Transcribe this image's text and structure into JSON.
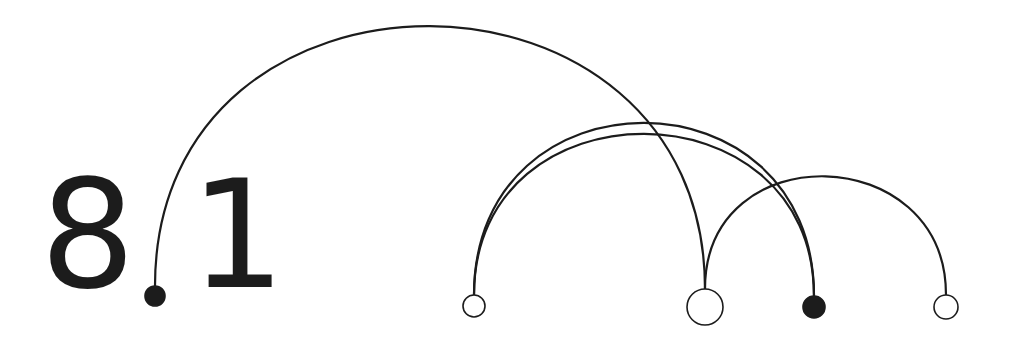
{
  "label": {
    "major": "8",
    "minor": "1"
  },
  "colors": {
    "stroke": "#1c1c1c",
    "background": "#ffffff"
  },
  "nodes": [
    {
      "id": "dot",
      "cx": 155,
      "cy": 296,
      "r": 10,
      "filled": true
    },
    {
      "id": "a",
      "cx": 474,
      "cy": 306,
      "r": 11,
      "filled": false
    },
    {
      "id": "b",
      "cx": 705,
      "cy": 307,
      "r": 18,
      "filled": false
    },
    {
      "id": "c",
      "cx": 814,
      "cy": 307,
      "r": 11,
      "filled": true
    },
    {
      "id": "d",
      "cx": 946,
      "cy": 307,
      "r": 12,
      "filled": false
    }
  ],
  "arcs": [
    {
      "from": "dot",
      "to": "b",
      "top_y": 24
    },
    {
      "from": "a",
      "to": "c",
      "top_y": 122
    },
    {
      "from": "a",
      "to": "c",
      "top_y": 133
    },
    {
      "from": "b",
      "to": "d",
      "top_y": 173
    }
  ]
}
